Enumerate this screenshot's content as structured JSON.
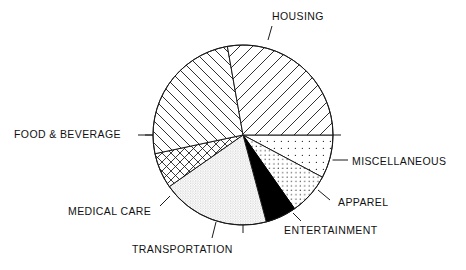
{
  "chart_data": {
    "type": "pie",
    "title": "",
    "subtitle": "",
    "xlabel": "",
    "ylabel": "",
    "legend_position": "outside-labels",
    "grid": false,
    "center": {
      "x": 243,
      "y": 135
    },
    "radius": 90,
    "start_angle_deg": 0,
    "direction": "clockwise",
    "categories": [
      "MISCELLANEOUS",
      "APPAREL",
      "ENTERTAINMENT",
      "TRANSPORTATION",
      "MEDICAL CARE",
      "FOOD & BEVERAGE",
      "HOUSING"
    ],
    "values": [
      7.8,
      7.5,
      5.6,
      19.4,
      6.4,
      25.6,
      27.8
    ],
    "slices": [
      {
        "label": "MISCELLANEOUS",
        "value": 7.8,
        "start_deg": 0,
        "end_deg": 28,
        "pattern": "sparse-dots",
        "fill": "#ffffff",
        "ink": "#1a1a1a"
      },
      {
        "label": "APPAREL",
        "value": 7.5,
        "start_deg": 28,
        "end_deg": 55,
        "pattern": "medium-dots",
        "fill": "#ffffff",
        "ink": "#1a1a1a"
      },
      {
        "label": "ENTERTAINMENT",
        "value": 5.6,
        "start_deg": 55,
        "end_deg": 75,
        "pattern": "solid",
        "fill": "#000000",
        "ink": "#000000"
      },
      {
        "label": "TRANSPORTATION",
        "value": 19.4,
        "start_deg": 75,
        "end_deg": 145,
        "pattern": "fine-stipple",
        "fill": "#ffffff",
        "ink": "#555555"
      },
      {
        "label": "MEDICAL CARE",
        "value": 6.4,
        "start_deg": 145,
        "end_deg": 168,
        "pattern": "crosshatch",
        "fill": "#ffffff",
        "ink": "#1a1a1a"
      },
      {
        "label": "FOOD & BEVERAGE",
        "value": 25.6,
        "start_deg": 168,
        "end_deg": 260,
        "pattern": "diagonal-hatch-down",
        "fill": "#ffffff",
        "ink": "#1a1a1a"
      },
      {
        "label": "HOUSING",
        "value": 27.8,
        "start_deg": 260,
        "end_deg": 360,
        "pattern": "diagonal-hatch-up",
        "fill": "#ffffff",
        "ink": "#1a1a1a"
      }
    ],
    "colors": {
      "outline": "#1a1a1a",
      "background": "#ffffff",
      "text": "#111111",
      "entertainment_fill": "#000000"
    }
  },
  "labels": {
    "housing": "HOUSING",
    "miscellaneous": "MISCELLANEOUS",
    "apparel": "APPAREL",
    "entertainment": "ENTERTAINMENT",
    "transportation": "TRANSPORTATION",
    "medical_care": "MEDICAL CARE",
    "food_beverage": "FOOD & BEVERAGE"
  }
}
